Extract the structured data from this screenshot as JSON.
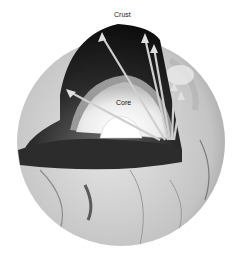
{
  "figure": {
    "labels": {
      "crust": "Crust",
      "core": "Core"
    },
    "colors": {
      "background": "#ffffff",
      "mantle_dark": "#1a1a1a",
      "surface_light": "#d8d8d8",
      "core_light": "#f2f2f2"
    }
  }
}
